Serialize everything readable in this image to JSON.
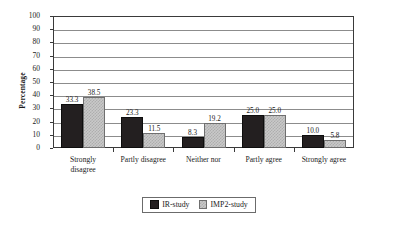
{
  "chart_data": {
    "type": "bar",
    "title": "",
    "xlabel": "",
    "ylabel": "Percentage",
    "ylim": [
      0,
      100
    ],
    "ytick_step": 10,
    "yticks": [
      100,
      90,
      80,
      70,
      60,
      50,
      40,
      30,
      20,
      10,
      0
    ],
    "grid": true,
    "legend_position": "bottom-center",
    "categories": [
      "Strongly\ndisagree",
      "Partly disagree",
      "Neither nor",
      "Partly agree",
      "Strongly agree"
    ],
    "series": [
      {
        "name": "IR-study",
        "color": "#231f20",
        "fill": "solid-black",
        "values": [
          33.3,
          23.3,
          8.3,
          25.0,
          10.0
        ],
        "labels": [
          "33.3",
          "23.3",
          "8.3",
          "25.0",
          "10.0"
        ]
      },
      {
        "name": "IMP2-study",
        "color": "#c9c9c9",
        "fill": "checkered-gray",
        "values": [
          38.5,
          11.5,
          19.2,
          25.0,
          5.8
        ],
        "labels": [
          "38.5",
          "11.5",
          "19.2",
          "25.0",
          "5.8"
        ]
      }
    ]
  }
}
